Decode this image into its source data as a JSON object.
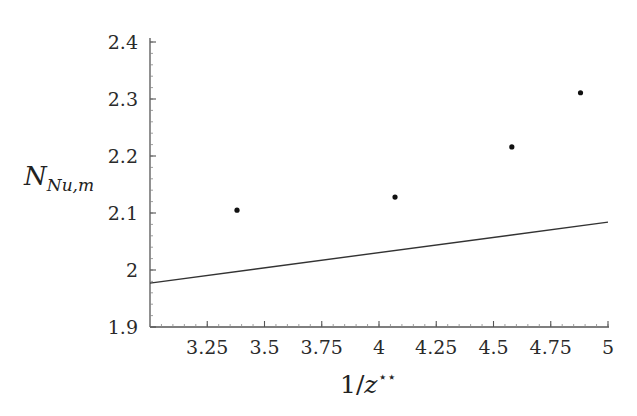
{
  "chart_data": {
    "type": "scatter",
    "title": "",
    "xlabel": "1/z**",
    "ylabel": "N_Nu,m",
    "xlim": [
      3.0,
      5.0
    ],
    "ylim": [
      1.9,
      2.4
    ],
    "grid": false,
    "legend": null,
    "x_ticks": [
      "3.25",
      "3.5",
      "3.75",
      "4",
      "4.25",
      "4.5",
      "4.75",
      "5"
    ],
    "y_ticks": [
      "1.9",
      "2",
      "2.1",
      "2.2",
      "2.3",
      "2.4"
    ],
    "series": [
      {
        "name": "data points",
        "type": "scatter",
        "x": [
          3.38,
          4.07,
          4.58,
          4.88
        ],
        "y": [
          2.105,
          2.128,
          2.216,
          2.311
        ]
      },
      {
        "name": "fit line",
        "type": "line",
        "x": [
          3.0,
          5.0
        ],
        "y": [
          1.977,
          2.084
        ]
      }
    ]
  },
  "labels": {
    "x_main": "1/",
    "x_var": "z",
    "x_sup": "⋆⋆",
    "y_main": "N",
    "y_sub": "Nu,m"
  }
}
